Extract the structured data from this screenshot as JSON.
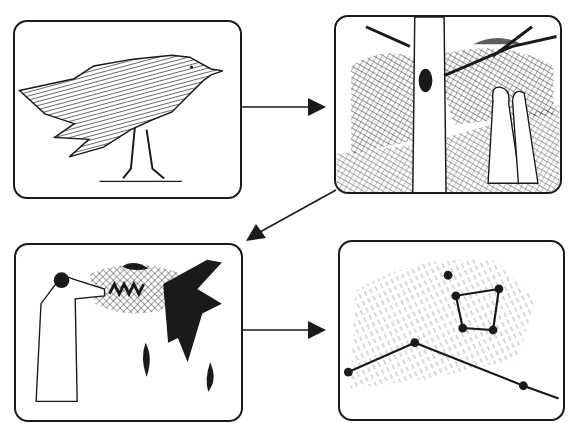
{
  "diagram": {
    "type": "four-panel sequence",
    "panels": [
      {
        "id": "p1",
        "label": "Crow standing",
        "position": "top-left"
      },
      {
        "id": "p2",
        "label": "Two figures under tree with bird nest",
        "position": "top-right"
      },
      {
        "id": "p3",
        "label": "Figure casting spell at black bird, feathers falling",
        "position": "bottom-left"
      },
      {
        "id": "p4",
        "label": "Constellation of connected star points",
        "position": "bottom-right"
      }
    ],
    "edges": [
      {
        "from": "p1",
        "to": "p2",
        "direction": "right"
      },
      {
        "from": "p2",
        "to": "p3",
        "direction": "down-left"
      },
      {
        "from": "p3",
        "to": "p4",
        "direction": "right"
      }
    ],
    "colors": {
      "ink": "#1a1a1a",
      "background": "#ffffff"
    }
  }
}
